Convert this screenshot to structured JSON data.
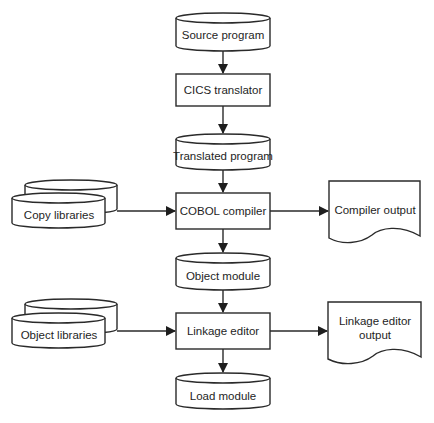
{
  "diagram": {
    "type": "flowchart",
    "main_flow": {
      "source_program": "Source program",
      "cics_translator": "CICS translator",
      "translated_program": "Translated program",
      "cobol_compiler": "COBOL compiler",
      "object_module": "Object module",
      "linkage_editor": "Linkage editor",
      "load_module": "Load module"
    },
    "inputs": {
      "copy_libraries": "Copy libraries",
      "object_libraries": "Object libraries"
    },
    "outputs": {
      "compiler_output": "Compiler output",
      "linkage_editor_output_line1": "Linkage editor",
      "linkage_editor_output_line2": "output"
    },
    "edges": [
      {
        "from": "Source program",
        "to": "CICS translator"
      },
      {
        "from": "CICS translator",
        "to": "Translated program"
      },
      {
        "from": "Translated program",
        "to": "COBOL compiler"
      },
      {
        "from": "Copy libraries",
        "to": "COBOL compiler"
      },
      {
        "from": "COBOL compiler",
        "to": "Compiler output"
      },
      {
        "from": "COBOL compiler",
        "to": "Object module"
      },
      {
        "from": "Object module",
        "to": "Linkage editor"
      },
      {
        "from": "Object libraries",
        "to": "Linkage editor"
      },
      {
        "from": "Linkage editor",
        "to": "Linkage editor output"
      },
      {
        "from": "Linkage editor",
        "to": "Load module"
      }
    ]
  }
}
